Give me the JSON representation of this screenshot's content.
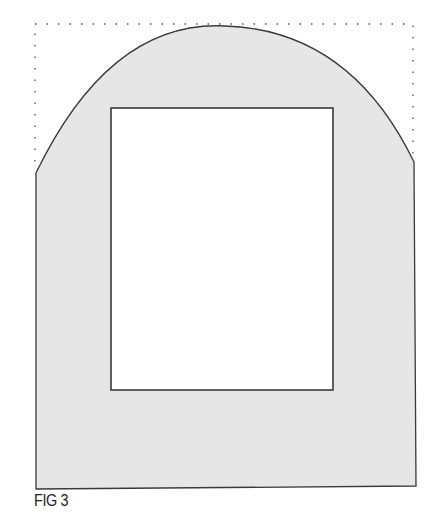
{
  "figure": {
    "caption": "FIG 3",
    "colors": {
      "fill": "#e6e6e6",
      "stroke": "#3a3a3a",
      "inner_fill": "#ffffff",
      "guide": "#555555"
    }
  }
}
